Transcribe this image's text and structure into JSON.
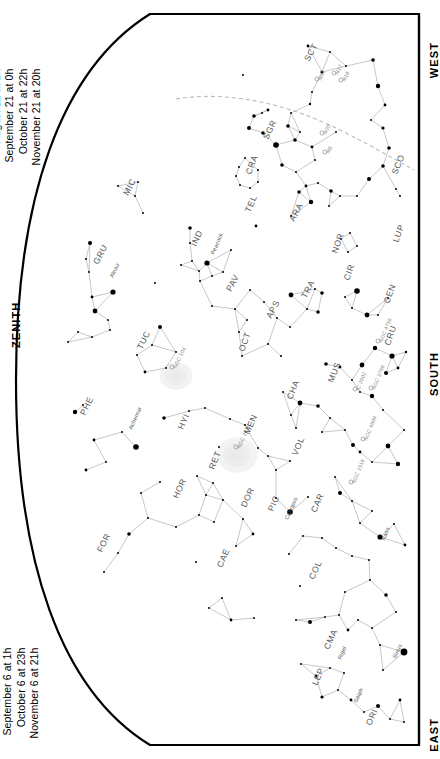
{
  "chart": {
    "type": "star-chart",
    "hemisphere": "southern",
    "projection": "half-dome horizon",
    "background_color": "#ffffff",
    "ink_color": "#000000",
    "label_color": "#555555",
    "dso_color": "#888888",
    "ecliptic_color": "#b9b9b9",
    "horizon_line_color": "#000000"
  },
  "dates_top": {
    "rows": [
      "July 21 at  4h",
      "August 21 at  2h",
      "September 21 at  0h",
      "October 21 at 22h",
      "November 21 at 20h"
    ]
  },
  "dates_bottom": {
    "rows": [
      "July 6 at  5h",
      "August 6 at  3h",
      "September 6 at  1h",
      "October 6 at 23h",
      "November 6 at 21h"
    ]
  },
  "cardinals": {
    "west": "WEST",
    "south": "SOUTH",
    "east": "EAST",
    "zenith": "ZENITH"
  },
  "constellations": [
    {
      "abbr": "SCT",
      "x": 309,
      "y": 62,
      "rot": -62
    },
    {
      "abbr": "SGR",
      "x": 268,
      "y": 140,
      "rot": -64
    },
    {
      "abbr": "CRA",
      "x": 251,
      "y": 175,
      "rot": -70
    },
    {
      "abbr": "SCO",
      "x": 397,
      "y": 175,
      "rot": -68
    },
    {
      "abbr": "MIC",
      "x": 128,
      "y": 196,
      "rot": -62
    },
    {
      "abbr": "TEL",
      "x": 250,
      "y": 213,
      "rot": -66
    },
    {
      "abbr": "ARA",
      "x": 294,
      "y": 222,
      "rot": -62
    },
    {
      "abbr": "LUP",
      "x": 398,
      "y": 243,
      "rot": -70
    },
    {
      "abbr": "IND",
      "x": 196,
      "y": 247,
      "rot": -66
    },
    {
      "abbr": "GRU",
      "x": 98,
      "y": 265,
      "rot": -62
    },
    {
      "abbr": "NOR",
      "x": 337,
      "y": 254,
      "rot": -70
    },
    {
      "abbr": "PAV",
      "x": 231,
      "y": 292,
      "rot": -62
    },
    {
      "abbr": "TRA",
      "x": 306,
      "y": 299,
      "rot": -62
    },
    {
      "abbr": "CIR",
      "x": 349,
      "y": 281,
      "rot": -70
    },
    {
      "abbr": "CEN",
      "x": 389,
      "y": 304,
      "rot": -70
    },
    {
      "abbr": "APS",
      "x": 271,
      "y": 319,
      "rot": -62
    },
    {
      "abbr": "TUC",
      "x": 142,
      "y": 350,
      "rot": -64
    },
    {
      "abbr": "OCT",
      "x": 244,
      "y": 352,
      "rot": -70
    },
    {
      "abbr": "CRU",
      "x": 390,
      "y": 346,
      "rot": -72
    },
    {
      "abbr": "MUS",
      "x": 333,
      "y": 383,
      "rot": -68
    },
    {
      "abbr": "CHA",
      "x": 292,
      "y": 400,
      "rot": -68
    },
    {
      "abbr": "PHE",
      "x": 85,
      "y": 416,
      "rot": -64
    },
    {
      "abbr": "HYI",
      "x": 183,
      "y": 430,
      "rot": -66
    },
    {
      "abbr": "MEN",
      "x": 249,
      "y": 435,
      "rot": -66
    },
    {
      "abbr": "VOL",
      "x": 297,
      "y": 456,
      "rot": -66
    },
    {
      "abbr": "RET",
      "x": 214,
      "y": 470,
      "rot": -68
    },
    {
      "abbr": "HOR",
      "x": 178,
      "y": 499,
      "rot": -66
    },
    {
      "abbr": "DOR",
      "x": 246,
      "y": 508,
      "rot": -66
    },
    {
      "abbr": "PIC",
      "x": 273,
      "y": 512,
      "rot": -66
    },
    {
      "abbr": "CAR",
      "x": 316,
      "y": 513,
      "rot": -66
    },
    {
      "abbr": "FOR",
      "x": 102,
      "y": 553,
      "rot": -64
    },
    {
      "abbr": "CAE",
      "x": 222,
      "y": 568,
      "rot": -66
    },
    {
      "abbr": "COL",
      "x": 314,
      "y": 580,
      "rot": -66
    },
    {
      "abbr": "CMA",
      "x": 329,
      "y": 650,
      "rot": -66
    },
    {
      "abbr": "LEP",
      "x": 317,
      "y": 686,
      "rot": -66
    },
    {
      "abbr": "ORI",
      "x": 371,
      "y": 726,
      "rot": -66
    }
  ],
  "named_stars": [
    {
      "name": "Alnair",
      "x": 113,
      "y": 278,
      "rot": -64
    },
    {
      "name": "Peacock",
      "x": 214,
      "y": 255,
      "rot": -66
    },
    {
      "name": "Achernar",
      "x": 132,
      "y": 430,
      "rot": -66
    },
    {
      "name": "Canopus",
      "x": 288,
      "y": 520,
      "rot": -66
    },
    {
      "name": "Naos",
      "x": 385,
      "y": 541,
      "rot": -70
    },
    {
      "name": "Sirius",
      "x": 396,
      "y": 659,
      "rot": -66
    },
    {
      "name": "Saiph",
      "x": 357,
      "y": 703,
      "rot": -66
    },
    {
      "name": "Rigel",
      "x": 341,
      "y": 660,
      "rot": -66
    }
  ],
  "deep_sky_objects": [
    {
      "name": "M17",
      "x": 334,
      "y": 73,
      "rot": -64
    },
    {
      "name": "M18",
      "x": 341,
      "y": 80,
      "rot": -64
    },
    {
      "name": "M20",
      "x": 322,
      "y": 133,
      "rot": -64
    },
    {
      "name": "M8",
      "x": 325,
      "y": 152,
      "rot": -64
    },
    {
      "name": "M47",
      "x": 317,
      "y": 79,
      "rot": -64
    },
    {
      "name": "NGC 104",
      "x": 172,
      "y": 367,
      "rot": -64
    },
    {
      "name": "NGC 2070",
      "x": 236,
      "y": 447,
      "rot": -66
    },
    {
      "name": "NGC 4755",
      "x": 378,
      "y": 341,
      "rot": -68
    },
    {
      "name": "NGC 3766",
      "x": 371,
      "y": 388,
      "rot": -68
    },
    {
      "name": "IC 2602",
      "x": 355,
      "y": 389,
      "rot": -68
    },
    {
      "name": "NGC 2516",
      "x": 351,
      "y": 482,
      "rot": -68
    },
    {
      "name": "NGC 4609",
      "x": 363,
      "y": 439,
      "rot": -68
    }
  ],
  "stars": [
    {
      "x": 308,
      "y": 46,
      "m": 1.4
    },
    {
      "x": 330,
      "y": 52,
      "m": 1.0
    },
    {
      "x": 346,
      "y": 66,
      "m": 1.0
    },
    {
      "x": 322,
      "y": 72,
      "m": 1.6
    },
    {
      "x": 312,
      "y": 92,
      "m": 1.0
    },
    {
      "x": 373,
      "y": 60,
      "m": 1.8
    },
    {
      "x": 378,
      "y": 86,
      "m": 2.2
    },
    {
      "x": 385,
      "y": 105,
      "m": 1.4
    },
    {
      "x": 371,
      "y": 120,
      "m": 1.0
    },
    {
      "x": 383,
      "y": 128,
      "m": 1.6
    },
    {
      "x": 243,
      "y": 75,
      "m": 1.0
    },
    {
      "x": 268,
      "y": 110,
      "m": 1.4
    },
    {
      "x": 254,
      "y": 116,
      "m": 1.8
    },
    {
      "x": 262,
      "y": 113,
      "m": 1.0
    },
    {
      "x": 291,
      "y": 113,
      "m": 1.0
    },
    {
      "x": 249,
      "y": 128,
      "m": 2.0
    },
    {
      "x": 263,
      "y": 133,
      "m": 1.8
    },
    {
      "x": 288,
      "y": 126,
      "m": 1.8
    },
    {
      "x": 295,
      "y": 140,
      "m": 1.8
    },
    {
      "x": 300,
      "y": 132,
      "m": 1.0
    },
    {
      "x": 276,
      "y": 145,
      "m": 2.8
    },
    {
      "x": 312,
      "y": 147,
      "m": 1.4
    },
    {
      "x": 282,
      "y": 165,
      "m": 1.8
    },
    {
      "x": 296,
      "y": 172,
      "m": 1.0
    },
    {
      "x": 315,
      "y": 160,
      "m": 1.0
    },
    {
      "x": 336,
      "y": 132,
      "m": 1.0
    },
    {
      "x": 310,
      "y": 104,
      "m": 1.2
    },
    {
      "x": 245,
      "y": 158,
      "m": 1.0
    },
    {
      "x": 239,
      "y": 167,
      "m": 1.0
    },
    {
      "x": 236,
      "y": 176,
      "m": 1.0
    },
    {
      "x": 240,
      "y": 185,
      "m": 1.0
    },
    {
      "x": 250,
      "y": 188,
      "m": 1.0
    },
    {
      "x": 258,
      "y": 182,
      "m": 1.0
    },
    {
      "x": 258,
      "y": 170,
      "m": 1.0
    },
    {
      "x": 299,
      "y": 192,
      "m": 1.8
    },
    {
      "x": 306,
      "y": 186,
      "m": 1.4
    },
    {
      "x": 318,
      "y": 183,
      "m": 1.0
    },
    {
      "x": 331,
      "y": 191,
      "m": 1.8
    },
    {
      "x": 311,
      "y": 202,
      "m": 2.2
    },
    {
      "x": 329,
      "y": 206,
      "m": 1.0
    },
    {
      "x": 340,
      "y": 196,
      "m": 1.0
    },
    {
      "x": 357,
      "y": 196,
      "m": 1.0
    },
    {
      "x": 369,
      "y": 179,
      "m": 2.0
    },
    {
      "x": 383,
      "y": 166,
      "m": 1.8
    },
    {
      "x": 389,
      "y": 148,
      "m": 1.8
    },
    {
      "x": 396,
      "y": 189,
      "m": 1.0
    },
    {
      "x": 400,
      "y": 196,
      "m": 1.0
    },
    {
      "x": 118,
      "y": 186,
      "m": 1.0
    },
    {
      "x": 138,
      "y": 182,
      "m": 1.0
    },
    {
      "x": 143,
      "y": 213,
      "m": 1.0
    },
    {
      "x": 135,
      "y": 196,
      "m": 1.0
    },
    {
      "x": 90,
      "y": 243,
      "m": 2.0
    },
    {
      "x": 86,
      "y": 259,
      "m": 1.0
    },
    {
      "x": 89,
      "y": 272,
      "m": 1.0
    },
    {
      "x": 113,
      "y": 292,
      "m": 2.6
    },
    {
      "x": 92,
      "y": 297,
      "m": 1.4
    },
    {
      "x": 95,
      "y": 311,
      "m": 2.4
    },
    {
      "x": 108,
      "y": 320,
      "m": 1.0
    },
    {
      "x": 110,
      "y": 330,
      "m": 1.0
    },
    {
      "x": 92,
      "y": 337,
      "m": 1.0
    },
    {
      "x": 78,
      "y": 332,
      "m": 1.0
    },
    {
      "x": 68,
      "y": 342,
      "m": 1.0
    },
    {
      "x": 190,
      "y": 228,
      "m": 1.8
    },
    {
      "x": 181,
      "y": 265,
      "m": 1.0
    },
    {
      "x": 199,
      "y": 271,
      "m": 1.0
    },
    {
      "x": 212,
      "y": 276,
      "m": 1.0
    },
    {
      "x": 155,
      "y": 283,
      "m": 1.0
    },
    {
      "x": 190,
      "y": 243,
      "m": 1.0
    },
    {
      "x": 192,
      "y": 261,
      "m": 1.0
    },
    {
      "x": 207,
      "y": 263,
      "m": 2.6
    },
    {
      "x": 256,
      "y": 226,
      "m": 1.4
    },
    {
      "x": 291,
      "y": 216,
      "m": 1.0
    },
    {
      "x": 231,
      "y": 250,
      "m": 1.0
    },
    {
      "x": 223,
      "y": 272,
      "m": 1.0
    },
    {
      "x": 200,
      "y": 281,
      "m": 1.0
    },
    {
      "x": 212,
      "y": 306,
      "m": 1.0
    },
    {
      "x": 235,
      "y": 309,
      "m": 1.0
    },
    {
      "x": 250,
      "y": 290,
      "m": 1.0
    },
    {
      "x": 264,
      "y": 302,
      "m": 1.0
    },
    {
      "x": 247,
      "y": 320,
      "m": 1.0
    },
    {
      "x": 239,
      "y": 332,
      "m": 1.0
    },
    {
      "x": 277,
      "y": 318,
      "m": 1.0
    },
    {
      "x": 290,
      "y": 327,
      "m": 1.0
    },
    {
      "x": 291,
      "y": 295,
      "m": 2.4
    },
    {
      "x": 315,
      "y": 289,
      "m": 1.0
    },
    {
      "x": 322,
      "y": 293,
      "m": 1.8
    },
    {
      "x": 318,
      "y": 312,
      "m": 1.8
    },
    {
      "x": 307,
      "y": 309,
      "m": 1.0
    },
    {
      "x": 345,
      "y": 297,
      "m": 1.0
    },
    {
      "x": 352,
      "y": 308,
      "m": 1.0
    },
    {
      "x": 357,
      "y": 291,
      "m": 2.8
    },
    {
      "x": 367,
      "y": 315,
      "m": 2.4
    },
    {
      "x": 378,
      "y": 315,
      "m": 1.0
    },
    {
      "x": 388,
      "y": 298,
      "m": 1.0
    },
    {
      "x": 341,
      "y": 239,
      "m": 1.0
    },
    {
      "x": 350,
      "y": 233,
      "m": 1.0
    },
    {
      "x": 357,
      "y": 246,
      "m": 1.0
    },
    {
      "x": 348,
      "y": 252,
      "m": 1.0
    },
    {
      "x": 160,
      "y": 327,
      "m": 2.0
    },
    {
      "x": 152,
      "y": 345,
      "m": 1.0
    },
    {
      "x": 137,
      "y": 355,
      "m": 1.0
    },
    {
      "x": 145,
      "y": 372,
      "m": 1.4
    },
    {
      "x": 166,
      "y": 368,
      "m": 1.0
    },
    {
      "x": 176,
      "y": 352,
      "m": 1.0
    },
    {
      "x": 242,
      "y": 356,
      "m": 1.0
    },
    {
      "x": 268,
      "y": 344,
      "m": 1.0
    },
    {
      "x": 281,
      "y": 356,
      "m": 1.0
    },
    {
      "x": 375,
      "y": 348,
      "m": 2.2
    },
    {
      "x": 392,
      "y": 356,
      "m": 2.6
    },
    {
      "x": 362,
      "y": 365,
      "m": 2.4
    },
    {
      "x": 386,
      "y": 373,
      "m": 2.0
    },
    {
      "x": 398,
      "y": 368,
      "m": 1.4
    },
    {
      "x": 406,
      "y": 352,
      "m": 1.2
    },
    {
      "x": 326,
      "y": 364,
      "m": 1.8
    },
    {
      "x": 340,
      "y": 367,
      "m": 1.4
    },
    {
      "x": 352,
      "y": 380,
      "m": 1.0
    },
    {
      "x": 360,
      "y": 392,
      "m": 1.0
    },
    {
      "x": 372,
      "y": 396,
      "m": 2.2
    },
    {
      "x": 383,
      "y": 410,
      "m": 1.0
    },
    {
      "x": 330,
      "y": 418,
      "m": 1.0
    },
    {
      "x": 318,
      "y": 406,
      "m": 1.8
    },
    {
      "x": 300,
      "y": 403,
      "m": 2.4
    },
    {
      "x": 322,
      "y": 432,
      "m": 1.0
    },
    {
      "x": 345,
      "y": 430,
      "m": 1.0
    },
    {
      "x": 353,
      "y": 445,
      "m": 2.0
    },
    {
      "x": 360,
      "y": 452,
      "m": 1.4
    },
    {
      "x": 372,
      "y": 462,
      "m": 1.0
    },
    {
      "x": 388,
      "y": 446,
      "m": 2.4
    },
    {
      "x": 398,
      "y": 464,
      "m": 2.2
    },
    {
      "x": 404,
      "y": 430,
      "m": 1.0
    },
    {
      "x": 283,
      "y": 392,
      "m": 1.0
    },
    {
      "x": 291,
      "y": 415,
      "m": 1.0
    },
    {
      "x": 296,
      "y": 428,
      "m": 1.0
    },
    {
      "x": 75,
      "y": 412,
      "m": 2.2
    },
    {
      "x": 94,
      "y": 440,
      "m": 1.4
    },
    {
      "x": 86,
      "y": 470,
      "m": 1.4
    },
    {
      "x": 106,
      "y": 462,
      "m": 1.0
    },
    {
      "x": 122,
      "y": 432,
      "m": 1.0
    },
    {
      "x": 83,
      "y": 405,
      "m": 1.0
    },
    {
      "x": 136,
      "y": 447,
      "m": 2.8
    },
    {
      "x": 164,
      "y": 418,
      "m": 1.8
    },
    {
      "x": 189,
      "y": 411,
      "m": 1.0
    },
    {
      "x": 205,
      "y": 408,
      "m": 1.0
    },
    {
      "x": 219,
      "y": 447,
      "m": 1.0
    },
    {
      "x": 160,
      "y": 482,
      "m": 1.0
    },
    {
      "x": 141,
      "y": 493,
      "m": 1.0
    },
    {
      "x": 148,
      "y": 518,
      "m": 1.0
    },
    {
      "x": 129,
      "y": 534,
      "m": 1.8
    },
    {
      "x": 118,
      "y": 553,
      "m": 1.0
    },
    {
      "x": 104,
      "y": 572,
      "m": 1.0
    },
    {
      "x": 230,
      "y": 419,
      "m": 1.0
    },
    {
      "x": 245,
      "y": 425,
      "m": 1.0
    },
    {
      "x": 258,
      "y": 448,
      "m": 1.0
    },
    {
      "x": 268,
      "y": 456,
      "m": 1.0
    },
    {
      "x": 276,
      "y": 470,
      "m": 1.0
    },
    {
      "x": 290,
      "y": 461,
      "m": 1.0
    },
    {
      "x": 197,
      "y": 476,
      "m": 1.0
    },
    {
      "x": 213,
      "y": 483,
      "m": 1.0
    },
    {
      "x": 206,
      "y": 495,
      "m": 1.0
    },
    {
      "x": 223,
      "y": 500,
      "m": 1.0
    },
    {
      "x": 199,
      "y": 515,
      "m": 1.0
    },
    {
      "x": 176,
      "y": 527,
      "m": 1.0
    },
    {
      "x": 214,
      "y": 522,
      "m": 1.0
    },
    {
      "x": 243,
      "y": 519,
      "m": 1.0
    },
    {
      "x": 253,
      "y": 534,
      "m": 1.4
    },
    {
      "x": 290,
      "y": 512,
      "m": 2.8
    },
    {
      "x": 276,
      "y": 498,
      "m": 1.0
    },
    {
      "x": 308,
      "y": 497,
      "m": 1.0
    },
    {
      "x": 335,
      "y": 477,
      "m": 1.0
    },
    {
      "x": 340,
      "y": 493,
      "m": 2.0
    },
    {
      "x": 352,
      "y": 501,
      "m": 1.0
    },
    {
      "x": 360,
      "y": 523,
      "m": 1.0
    },
    {
      "x": 372,
      "y": 511,
      "m": 1.0
    },
    {
      "x": 380,
      "y": 537,
      "m": 2.6
    },
    {
      "x": 394,
      "y": 524,
      "m": 1.0
    },
    {
      "x": 405,
      "y": 545,
      "m": 1.4
    },
    {
      "x": 322,
      "y": 538,
      "m": 1.0
    },
    {
      "x": 336,
      "y": 548,
      "m": 1.0
    },
    {
      "x": 352,
      "y": 556,
      "m": 1.0
    },
    {
      "x": 369,
      "y": 560,
      "m": 1.0
    },
    {
      "x": 303,
      "y": 536,
      "m": 1.0
    },
    {
      "x": 196,
      "y": 562,
      "m": 1.0
    },
    {
      "x": 236,
      "y": 546,
      "m": 1.0
    },
    {
      "x": 222,
      "y": 598,
      "m": 1.0
    },
    {
      "x": 209,
      "y": 608,
      "m": 1.0
    },
    {
      "x": 231,
      "y": 620,
      "m": 1.4
    },
    {
      "x": 254,
      "y": 618,
      "m": 1.0
    },
    {
      "x": 289,
      "y": 554,
      "m": 1.0
    },
    {
      "x": 300,
      "y": 586,
      "m": 1.0
    },
    {
      "x": 296,
      "y": 620,
      "m": 1.0
    },
    {
      "x": 310,
      "y": 622,
      "m": 2.0
    },
    {
      "x": 325,
      "y": 617,
      "m": 1.0
    },
    {
      "x": 339,
      "y": 615,
      "m": 1.0
    },
    {
      "x": 348,
      "y": 630,
      "m": 1.4
    },
    {
      "x": 345,
      "y": 592,
      "m": 1.0
    },
    {
      "x": 370,
      "y": 580,
      "m": 1.0
    },
    {
      "x": 386,
      "y": 595,
      "m": 1.8
    },
    {
      "x": 396,
      "y": 612,
      "m": 1.0
    },
    {
      "x": 404,
      "y": 652,
      "m": 3.4
    },
    {
      "x": 380,
      "y": 645,
      "m": 1.0
    },
    {
      "x": 372,
      "y": 628,
      "m": 1.0
    },
    {
      "x": 383,
      "y": 670,
      "m": 1.0
    },
    {
      "x": 358,
      "y": 620,
      "m": 1.0
    },
    {
      "x": 301,
      "y": 664,
      "m": 1.0
    },
    {
      "x": 316,
      "y": 676,
      "m": 1.4
    },
    {
      "x": 330,
      "y": 668,
      "m": 1.0
    },
    {
      "x": 344,
      "y": 673,
      "m": 1.0
    },
    {
      "x": 338,
      "y": 690,
      "m": 1.0
    },
    {
      "x": 322,
      "y": 697,
      "m": 1.6
    },
    {
      "x": 351,
      "y": 700,
      "m": 1.4
    },
    {
      "x": 364,
      "y": 712,
      "m": 1.0
    },
    {
      "x": 378,
      "y": 706,
      "m": 2.0
    },
    {
      "x": 390,
      "y": 719,
      "m": 1.0
    },
    {
      "x": 400,
      "y": 700,
      "m": 1.4
    },
    {
      "x": 404,
      "y": 722,
      "m": 1.0
    }
  ],
  "nebulae": [
    {
      "name": "SMC",
      "x": 176,
      "y": 376,
      "rx": 12,
      "ry": 10
    },
    {
      "name": "LMC",
      "x": 237,
      "y": 455,
      "rx": 15,
      "ry": 13
    }
  ]
}
